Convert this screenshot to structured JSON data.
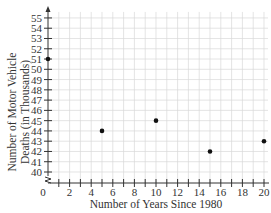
{
  "chart_data": {
    "type": "scatter",
    "title": "",
    "xlabel": "Number of Years Since 1980",
    "ylabel_line1": "Number of Motor Vehicle",
    "ylabel_line2": "Deaths (in Thousands)",
    "x": [
      0,
      5,
      10,
      15,
      20
    ],
    "y": [
      51,
      44,
      45,
      42,
      43
    ],
    "xlim": [
      0,
      20
    ],
    "ylim": [
      40,
      55
    ],
    "y_axis_break": true,
    "grid": true,
    "x_ticks": [
      "0",
      "2",
      "4",
      "6",
      "8",
      "10",
      "12",
      "14",
      "16",
      "18",
      "20"
    ],
    "y_ticks": [
      "40",
      "41",
      "42",
      "43",
      "44",
      "45",
      "46",
      "47",
      "48",
      "49",
      "50",
      "51",
      "52",
      "53",
      "54",
      "55"
    ],
    "colors": {
      "point": "#111111",
      "grid": "#d9d9d9",
      "axis": "#333333"
    }
  }
}
